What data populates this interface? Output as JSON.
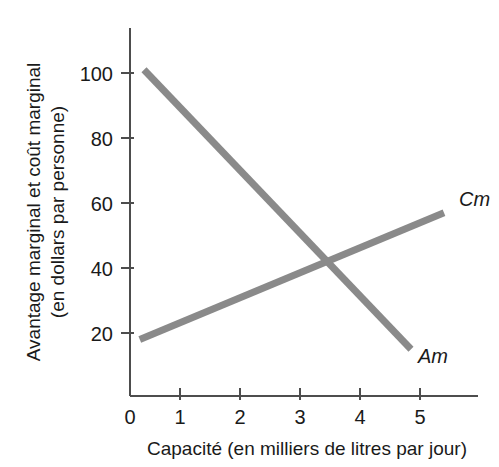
{
  "chart_data": {
    "type": "line",
    "title": "",
    "xlabel": "Capacité (en milliers de litres par jour)",
    "ylabel_line1": "Avantage marginal et coût marginal",
    "ylabel_line2": "(en dollars par personne)",
    "xlim": [
      0,
      6.0
    ],
    "ylim": [
      0,
      112
    ],
    "grid": false,
    "legend_position": "inline-right-end-of-line",
    "x_ticks": [
      "0",
      "1",
      "2",
      "3",
      "4",
      "5"
    ],
    "x_tick_values": [
      0,
      1,
      2,
      3,
      4,
      5
    ],
    "y_ticks": [
      "20",
      "40",
      "60",
      "80",
      "100"
    ],
    "y_tick_values": [
      20,
      40,
      60,
      80,
      100
    ],
    "series": [
      {
        "name": "Am",
        "label": "Am",
        "color": "#8a8a8a",
        "description": "Avantage marginal — droite décroissante",
        "x": [
          0.4,
          4.85
        ],
        "values": [
          101,
          15
        ]
      },
      {
        "name": "Cm",
        "label": "Cm",
        "color": "#8a8a8a",
        "description": "Coût marginal — droite croissante",
        "x": [
          0.33,
          5.4
        ],
        "values": [
          18,
          57
        ]
      }
    ],
    "intersection": {
      "x": 3.4,
      "y": 42
    }
  },
  "labels": {
    "cm": "Cm",
    "am": "Am"
  },
  "axis": {
    "x_title": "Capacité (en milliers de litres par jour)",
    "y_title_line1": "Avantage marginal et coût marginal",
    "y_title_line2": "(en dollars par personne)",
    "x_tick_0": "0",
    "x_tick_1": "1",
    "x_tick_2": "2",
    "x_tick_3": "3",
    "x_tick_4": "4",
    "x_tick_5": "5",
    "y_tick_20": "20",
    "y_tick_40": "40",
    "y_tick_60": "60",
    "y_tick_80": "80",
    "y_tick_100": "100"
  },
  "colors": {
    "series": "#8a8a8a",
    "axis": "#4d4d4d",
    "text": "#1a1a1a",
    "background": "#ffffff"
  }
}
